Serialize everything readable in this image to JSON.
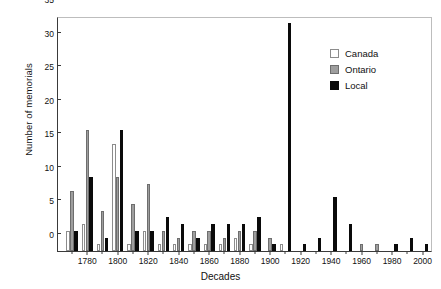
{
  "chart_data": {
    "type": "bar",
    "title": "",
    "xlabel": "Decades",
    "ylabel": "Number of memorials",
    "ylim": [
      0,
      35
    ],
    "yticks": [
      0,
      5,
      10,
      15,
      20,
      25,
      30,
      35
    ],
    "grid": false,
    "legend_position": "upper-right",
    "categories": [
      "1770",
      "1780",
      "1790",
      "1800",
      "1810",
      "1820",
      "1830",
      "1840",
      "1850",
      "1860",
      "1870",
      "1880",
      "1890",
      "1900",
      "1910",
      "1920",
      "1930",
      "1940",
      "1950",
      "1960",
      "1970",
      "1980",
      "1990",
      "2000"
    ],
    "series": [
      {
        "name": "Canada",
        "color": "#ffffff",
        "values": [
          3,
          4,
          1,
          16,
          1,
          3,
          1,
          1,
          1,
          1,
          1,
          2,
          1,
          0,
          1,
          0,
          0,
          0,
          0,
          0,
          0,
          0,
          0,
          0
        ]
      },
      {
        "name": "Ontario",
        "color": "#9e9e9e",
        "values": [
          9,
          18,
          6,
          11,
          7,
          10,
          3,
          2,
          3,
          3,
          2,
          3,
          3,
          2,
          0,
          0,
          0,
          0,
          0,
          1,
          1,
          0,
          0,
          0
        ]
      },
      {
        "name": "Local",
        "color": "#0a0a0a",
        "values": [
          3,
          11,
          2,
          18,
          3,
          3,
          5,
          4,
          2,
          4,
          4,
          4,
          5,
          1,
          34,
          1,
          2,
          8,
          4,
          0,
          0,
          1,
          2,
          1
        ]
      }
    ],
    "xtick_labels": [
      {
        "decade": "1780",
        "value": 1780
      },
      {
        "decade": "1800",
        "value": 1800
      },
      {
        "decade": "1820",
        "value": 1820
      },
      {
        "decade": "1840",
        "value": 1840
      },
      {
        "decade": "1860",
        "value": 1860
      },
      {
        "decade": "1880",
        "value": 1880
      },
      {
        "decade": "1900",
        "value": 1900
      },
      {
        "decade": "1920",
        "value": 1920
      },
      {
        "decade": "1940",
        "value": 1940
      },
      {
        "decade": "1960",
        "value": 1960
      },
      {
        "decade": "1980",
        "value": 1980
      },
      {
        "decade": "2000",
        "value": 2000
      }
    ]
  },
  "legend": {
    "items": [
      {
        "label": "Canada",
        "key": "canada"
      },
      {
        "label": "Ontario",
        "key": "ontario"
      },
      {
        "label": "Local",
        "key": "local"
      }
    ]
  }
}
